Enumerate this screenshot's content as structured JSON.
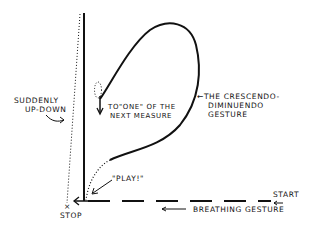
{
  "diagram": {
    "labels": {
      "suddenly": [
        "SUDDENLY",
        "UP-DOWN"
      ],
      "to_one": [
        "TO\"ONE\" OF THE",
        "NEXT MEASURE"
      ],
      "crescendo": [
        "←THE CRESCENDO-",
        "DIMINUENDO",
        "GESTURE"
      ],
      "play": "\"PLAY!\"",
      "start": "START",
      "stop": "STOP",
      "stop_mark": "×",
      "breathing": "BREATHING GESTURE"
    },
    "colors": {
      "ink": "#111111",
      "background": "#ffffff"
    }
  }
}
